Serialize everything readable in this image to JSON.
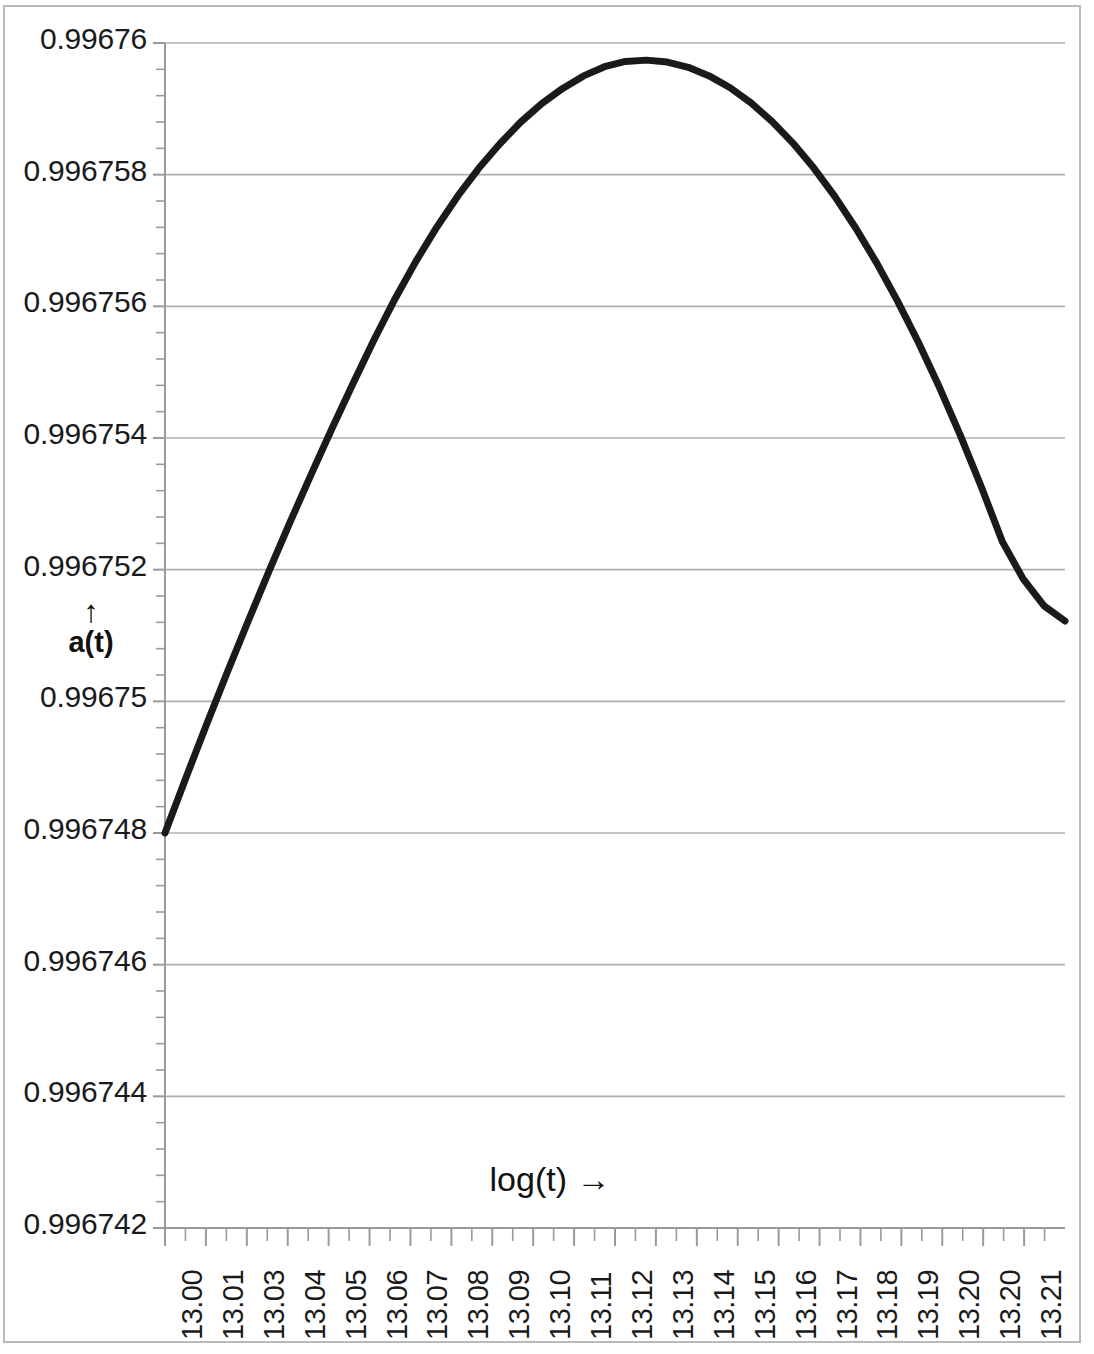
{
  "chart_data": {
    "type": "line",
    "title": "",
    "subtitle": "",
    "xlabel": "log(t) →",
    "ylabel": "a(t)",
    "ylabel_arrow": "↑",
    "grid": true,
    "grid_axis": "y",
    "legend": false,
    "legend_position": "none",
    "line_color": "#1a1a1a",
    "line_width": 7,
    "gridline_color": "#b0b0b0",
    "axis_color": "#9a9a9a",
    "background": "#ffffff",
    "xlim": [
      13.0,
      13.215
    ],
    "ylim": [
      0.996742,
      0.99676
    ],
    "ytick_step": 2e-06,
    "y_ticks": [
      "0.996742",
      "0.996744",
      "0.996746",
      "0.996748",
      "0.99675",
      "0.996752",
      "0.996754",
      "0.996756",
      "0.996758",
      "0.99676"
    ],
    "y_tick_values": [
      0.996742,
      0.996744,
      0.996746,
      0.996748,
      0.99675,
      0.996752,
      0.996754,
      0.996756,
      0.996758,
      0.99676
    ],
    "y_minor_ticks_per_major": 5,
    "x_tick_labels": [
      "13.00",
      "13.01",
      "13.03",
      "13.04",
      "13.05",
      "13.06",
      "13.07",
      "13.08",
      "13.09",
      "13.10",
      "13.11",
      "13.12",
      "13.13",
      "13.14",
      "13.15",
      "13.16",
      "13.17",
      "13.18",
      "13.19",
      "13.20",
      "13.20",
      "13.21"
    ],
    "x_minor_ticks_per_major": 2,
    "series": [
      {
        "name": "a(t)",
        "x": [
          13.0,
          13.005,
          13.01,
          13.015,
          13.02,
          13.025,
          13.03,
          13.035,
          13.04,
          13.045,
          13.05,
          13.055,
          13.06,
          13.065,
          13.07,
          13.075,
          13.08,
          13.085,
          13.09,
          13.095,
          13.1,
          13.105,
          13.11,
          13.115,
          13.12,
          13.125,
          13.13,
          13.135,
          13.14,
          13.145,
          13.15,
          13.155,
          13.16,
          13.165,
          13.17,
          13.175,
          13.18,
          13.185,
          13.19,
          13.195,
          13.2,
          13.205,
          13.21,
          13.215
        ],
        "y": [
          0.996748,
          0.99674884,
          0.99674966,
          0.99675046,
          0.99675124,
          0.996752,
          0.99675274,
          0.99675346,
          0.99675416,
          0.99675484,
          0.9967555,
          0.99675612,
          0.99675669,
          0.99675721,
          0.99675768,
          0.9967581,
          0.99675847,
          0.9967588,
          0.99675908,
          0.99675931,
          0.9967595,
          0.99675964,
          0.99675972,
          0.99675974,
          0.99675971,
          0.99675963,
          0.9967595,
          0.99675932,
          0.99675909,
          0.99675881,
          0.99675848,
          0.9967581,
          0.99675767,
          0.99675719,
          0.99675666,
          0.99675608,
          0.99675545,
          0.99675477,
          0.99675404,
          0.99675326,
          0.99675243,
          0.99675186,
          0.99675145,
          0.99675122
        ],
        "color": "#1a1a1a"
      }
    ],
    "annotations": {
      "start_point": {
        "x": 13.0,
        "y": 0.996748
      },
      "peak_point": {
        "x": 13.115,
        "y": 0.9967597
      },
      "end_point": {
        "x": 13.215,
        "y": 0.9967512
      }
    }
  },
  "axes": {
    "y_title": "a(t)",
    "y_arrow": "↑",
    "x_title": "log(t) →"
  }
}
